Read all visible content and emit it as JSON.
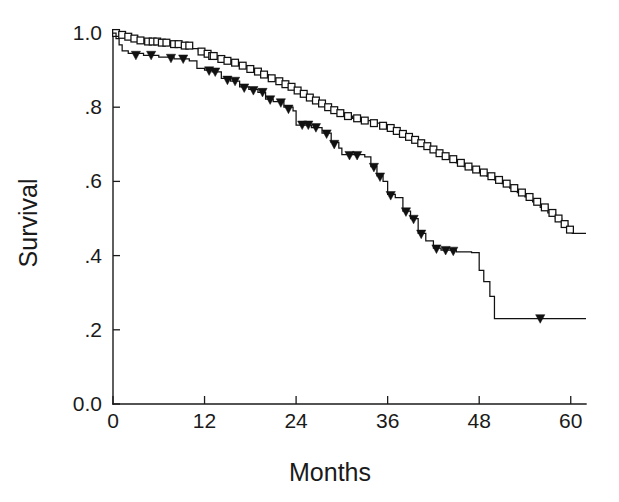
{
  "chart_data": {
    "type": "line",
    "subtype": "kaplan-meier-survival",
    "title": "",
    "xlabel": "Months",
    "ylabel": "Survival",
    "xlim": [
      0,
      62
    ],
    "ylim": [
      0.0,
      1.0
    ],
    "grid": false,
    "legend": "none",
    "xticks": [
      0,
      12,
      24,
      36,
      48,
      60
    ],
    "xtick_labels": [
      "0",
      "12",
      "24",
      "36",
      "48",
      "60"
    ],
    "yticks": [
      0.0,
      0.2,
      0.4,
      0.6,
      0.8,
      1.0
    ],
    "ytick_labels": [
      "0.0",
      ".2",
      ".4",
      ".6",
      ".8",
      "1.0"
    ],
    "series": [
      {
        "name": "upper-curve",
        "marker": "open-square",
        "censor_marker_label": "open square",
        "final_survival": 0.46,
        "steps": [
          [
            0.0,
            1.0
          ],
          [
            1.0,
            0.995
          ],
          [
            1.6,
            0.99
          ],
          [
            2.4,
            0.985
          ],
          [
            3.2,
            0.98
          ],
          [
            4.2,
            0.977
          ],
          [
            6.0,
            0.974
          ],
          [
            7.6,
            0.97
          ],
          [
            9.0,
            0.966
          ],
          [
            10.4,
            0.958
          ],
          [
            11.2,
            0.95
          ],
          [
            12.0,
            0.944
          ],
          [
            12.8,
            0.938
          ],
          [
            13.6,
            0.93
          ],
          [
            14.6,
            0.925
          ],
          [
            15.6,
            0.92
          ],
          [
            16.6,
            0.912
          ],
          [
            17.6,
            0.903
          ],
          [
            18.6,
            0.896
          ],
          [
            19.4,
            0.888
          ],
          [
            20.4,
            0.878
          ],
          [
            21.4,
            0.87
          ],
          [
            22.2,
            0.862
          ],
          [
            23.0,
            0.855
          ],
          [
            23.8,
            0.845
          ],
          [
            24.6,
            0.836
          ],
          [
            25.4,
            0.826
          ],
          [
            26.2,
            0.818
          ],
          [
            27.0,
            0.81
          ],
          [
            27.8,
            0.8
          ],
          [
            28.6,
            0.792
          ],
          [
            29.4,
            0.784
          ],
          [
            30.4,
            0.776
          ],
          [
            31.4,
            0.77
          ],
          [
            32.6,
            0.764
          ],
          [
            33.8,
            0.757
          ],
          [
            35.0,
            0.75
          ],
          [
            36.0,
            0.744
          ],
          [
            36.8,
            0.736
          ],
          [
            37.6,
            0.728
          ],
          [
            38.4,
            0.72
          ],
          [
            39.2,
            0.712
          ],
          [
            40.0,
            0.703
          ],
          [
            40.8,
            0.695
          ],
          [
            41.6,
            0.686
          ],
          [
            42.4,
            0.676
          ],
          [
            43.2,
            0.668
          ],
          [
            44.0,
            0.66
          ],
          [
            45.0,
            0.65
          ],
          [
            46.0,
            0.64
          ],
          [
            47.0,
            0.632
          ],
          [
            48.0,
            0.624
          ],
          [
            49.0,
            0.614
          ],
          [
            50.0,
            0.604
          ],
          [
            51.0,
            0.594
          ],
          [
            52.0,
            0.582
          ],
          [
            53.0,
            0.57
          ],
          [
            54.0,
            0.558
          ],
          [
            55.0,
            0.545
          ],
          [
            56.0,
            0.53
          ],
          [
            57.0,
            0.515
          ],
          [
            58.0,
            0.5
          ],
          [
            58.8,
            0.485
          ],
          [
            59.6,
            0.47
          ],
          [
            60.2,
            0.46
          ],
          [
            62.0,
            0.46
          ]
        ],
        "censor_points": [
          [
            0.4,
            1.0
          ],
          [
            1.2,
            0.995
          ],
          [
            2.0,
            0.99
          ],
          [
            2.8,
            0.985
          ],
          [
            3.6,
            0.98
          ],
          [
            4.6,
            0.977
          ],
          [
            5.2,
            0.977
          ],
          [
            5.8,
            0.977
          ],
          [
            6.4,
            0.974
          ],
          [
            7.0,
            0.974
          ],
          [
            8.0,
            0.97
          ],
          [
            8.6,
            0.97
          ],
          [
            9.4,
            0.966
          ],
          [
            10.0,
            0.966
          ],
          [
            11.6,
            0.95
          ],
          [
            12.4,
            0.944
          ],
          [
            13.0,
            0.938
          ],
          [
            13.2,
            0.938
          ],
          [
            14.2,
            0.93
          ],
          [
            15.0,
            0.925
          ],
          [
            16.0,
            0.92
          ],
          [
            17.0,
            0.912
          ],
          [
            18.0,
            0.903
          ],
          [
            19.0,
            0.896
          ],
          [
            19.8,
            0.888
          ],
          [
            20.8,
            0.878
          ],
          [
            21.8,
            0.87
          ],
          [
            22.6,
            0.862
          ],
          [
            23.4,
            0.855
          ],
          [
            24.2,
            0.845
          ],
          [
            25.0,
            0.836
          ],
          [
            25.8,
            0.826
          ],
          [
            26.6,
            0.818
          ],
          [
            27.4,
            0.81
          ],
          [
            28.2,
            0.8
          ],
          [
            29.0,
            0.792
          ],
          [
            29.8,
            0.784
          ],
          [
            30.8,
            0.776
          ],
          [
            32.0,
            0.77
          ],
          [
            33.0,
            0.764
          ],
          [
            34.2,
            0.757
          ],
          [
            35.4,
            0.75
          ],
          [
            36.4,
            0.744
          ],
          [
            37.2,
            0.736
          ],
          [
            38.0,
            0.728
          ],
          [
            38.8,
            0.72
          ],
          [
            39.6,
            0.712
          ],
          [
            40.4,
            0.703
          ],
          [
            41.2,
            0.695
          ],
          [
            42.0,
            0.686
          ],
          [
            42.8,
            0.676
          ],
          [
            43.6,
            0.668
          ],
          [
            44.6,
            0.66
          ],
          [
            45.6,
            0.65
          ],
          [
            46.6,
            0.64
          ],
          [
            47.6,
            0.632
          ],
          [
            48.6,
            0.624
          ],
          [
            49.6,
            0.614
          ],
          [
            50.6,
            0.604
          ],
          [
            51.6,
            0.594
          ],
          [
            52.6,
            0.582
          ],
          [
            53.6,
            0.57
          ],
          [
            54.6,
            0.558
          ],
          [
            55.6,
            0.545
          ],
          [
            56.6,
            0.53
          ],
          [
            57.6,
            0.515
          ],
          [
            58.4,
            0.5
          ],
          [
            59.2,
            0.485
          ],
          [
            59.9,
            0.47
          ]
        ]
      },
      {
        "name": "lower-curve",
        "marker": "filled-triangle",
        "censor_marker_label": "filled downward triangle",
        "final_survival": 0.23,
        "steps": [
          [
            0.0,
            1.0
          ],
          [
            0.4,
            0.985
          ],
          [
            0.8,
            0.968
          ],
          [
            1.2,
            0.952
          ],
          [
            2.0,
            0.945
          ],
          [
            4.0,
            0.94
          ],
          [
            6.0,
            0.935
          ],
          [
            8.0,
            0.93
          ],
          [
            10.0,
            0.925
          ],
          [
            11.0,
            0.905
          ],
          [
            12.0,
            0.9
          ],
          [
            13.0,
            0.895
          ],
          [
            14.2,
            0.878
          ],
          [
            15.4,
            0.87
          ],
          [
            16.6,
            0.855
          ],
          [
            17.8,
            0.848
          ],
          [
            19.0,
            0.84
          ],
          [
            20.0,
            0.822
          ],
          [
            21.0,
            0.815
          ],
          [
            22.4,
            0.8
          ],
          [
            23.6,
            0.79
          ],
          [
            24.0,
            0.752
          ],
          [
            26.0,
            0.745
          ],
          [
            27.4,
            0.73
          ],
          [
            28.6,
            0.705
          ],
          [
            29.6,
            0.69
          ],
          [
            30.0,
            0.672
          ],
          [
            33.0,
            0.666
          ],
          [
            33.8,
            0.64
          ],
          [
            34.6,
            0.615
          ],
          [
            35.4,
            0.6
          ],
          [
            36.0,
            0.565
          ],
          [
            37.0,
            0.556
          ],
          [
            38.0,
            0.52
          ],
          [
            39.0,
            0.5
          ],
          [
            40.0,
            0.46
          ],
          [
            41.0,
            0.44
          ],
          [
            42.0,
            0.42
          ],
          [
            43.0,
            0.415
          ],
          [
            45.0,
            0.41
          ],
          [
            47.0,
            0.408
          ],
          [
            48.0,
            0.36
          ],
          [
            48.6,
            0.33
          ],
          [
            49.4,
            0.29
          ],
          [
            50.0,
            0.23
          ],
          [
            62.0,
            0.23
          ]
        ],
        "censor_points": [
          [
            3.0,
            0.94
          ],
          [
            5.0,
            0.94
          ],
          [
            7.6,
            0.932
          ],
          [
            9.2,
            0.93
          ],
          [
            12.6,
            0.898
          ],
          [
            13.4,
            0.895
          ],
          [
            15.0,
            0.873
          ],
          [
            16.0,
            0.87
          ],
          [
            17.2,
            0.852
          ],
          [
            18.4,
            0.845
          ],
          [
            19.6,
            0.84
          ],
          [
            20.6,
            0.82
          ],
          [
            22.0,
            0.812
          ],
          [
            23.0,
            0.795
          ],
          [
            24.8,
            0.752
          ],
          [
            25.6,
            0.752
          ],
          [
            26.6,
            0.745
          ],
          [
            28.0,
            0.728
          ],
          [
            29.0,
            0.7
          ],
          [
            31.0,
            0.67
          ],
          [
            32.0,
            0.67
          ],
          [
            34.2,
            0.638
          ],
          [
            35.0,
            0.612
          ],
          [
            36.4,
            0.562
          ],
          [
            38.4,
            0.518
          ],
          [
            39.4,
            0.498
          ],
          [
            40.4,
            0.458
          ],
          [
            42.4,
            0.418
          ],
          [
            43.6,
            0.414
          ],
          [
            44.6,
            0.412
          ],
          [
            56.0,
            0.23
          ]
        ]
      }
    ]
  },
  "axes": {
    "y_title": "Survival",
    "x_title": "Months"
  },
  "colors": {
    "line": "#111111",
    "axis": "#1a1a1a",
    "background": "#ffffff",
    "marker_fill": "#ffffff"
  }
}
